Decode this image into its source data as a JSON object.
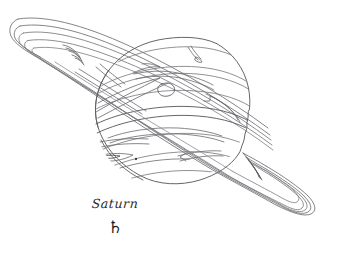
{
  "plate": {
    "background_color": "#ffffff",
    "ink_color": "#6f6f73",
    "ink_color_dark": "#4a4a4e",
    "width": 345,
    "height": 270,
    "subject": "Saturn",
    "style": "engraved line art",
    "alt_text": "Line engraving of the planet Saturn tilted with its ring system, cloud belts and a small oval spot"
  },
  "caption": {
    "name": "Saturn",
    "symbol": "♄",
    "symbol_name": "saturn-astronomical-symbol"
  },
  "figure": {
    "planet_label": "saturn-globe",
    "rings_label": "saturn-ring-system",
    "ring_count": 5,
    "band_count": 7,
    "spot_label": "oval-storm-spot",
    "dot_label": "small-marking-dot"
  }
}
